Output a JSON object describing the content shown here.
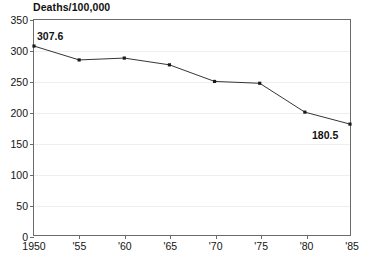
{
  "chart_data": {
    "type": "line",
    "title": "Deaths/100,000",
    "xlabel": "",
    "ylabel": "",
    "ylim": [
      0,
      350
    ],
    "ytick_step": 50,
    "yticks": [
      0,
      50,
      100,
      150,
      200,
      250,
      300,
      350
    ],
    "ytick_labels": [
      "0",
      "50",
      "100",
      "150",
      "200",
      "250",
      "300",
      "350"
    ],
    "xlim": [
      1950,
      1985
    ],
    "xticks": [
      1950,
      1955,
      1960,
      1965,
      1970,
      1975,
      1980,
      1985
    ],
    "xtick_labels": [
      "1950",
      "'55",
      "'60",
      "'65",
      "'70",
      "'75",
      "'80",
      "'85"
    ],
    "grid": true,
    "grid_axis": "y",
    "legend": false,
    "legend_position": "none",
    "x": [
      1950,
      1955,
      1960,
      1965,
      1970,
      1975,
      1980,
      1985
    ],
    "values": [
      307.6,
      285.0,
      288.0,
      277.0,
      250.0,
      247.0,
      200.0,
      180.5
    ],
    "series": [
      {
        "name": "Deaths per 100,000",
        "values": [
          307.6,
          285.0,
          288.0,
          277.0,
          250.0,
          247.0,
          200.0,
          180.5
        ]
      }
    ],
    "annotations": [
      {
        "text": "307.6",
        "x": 1950,
        "y": 307.6,
        "position": "above-right"
      },
      {
        "text": "180.5",
        "x": 1985,
        "y": 180.5,
        "position": "below-left"
      }
    ],
    "line_color": "#333333",
    "marker": "square",
    "marker_color": "#1a1a1a",
    "background_color": "#ffffff",
    "axis_color": "#6b6b6b",
    "grid_color": "#efefef"
  }
}
